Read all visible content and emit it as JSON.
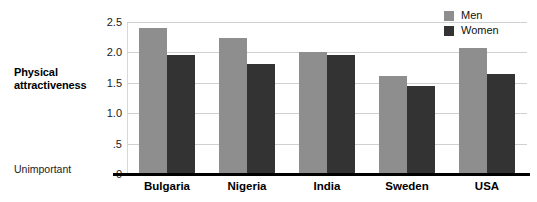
{
  "axis": {
    "y_title": "Physical attractiveness",
    "baseline_caption": "Unimportant",
    "y_ticks": [
      "2.5",
      "2.0",
      "1.5",
      "1.0",
      ".5",
      "0"
    ]
  },
  "legend": {
    "items": [
      {
        "label": "Men",
        "color": "#8e8e8e",
        "swatch": "legend-swatch-men"
      },
      {
        "label": "Women",
        "color": "#333333",
        "swatch": "legend-swatch-women"
      }
    ]
  },
  "chart_data": {
    "type": "bar",
    "title": "",
    "xlabel": "",
    "ylabel": "Physical attractiveness",
    "ylim": [
      0,
      2.5
    ],
    "yticks": [
      0,
      0.5,
      1.0,
      1.5,
      2.0,
      2.5
    ],
    "ytick_labels": [
      "0",
      ".5",
      "1.0",
      "1.5",
      "2.0",
      "2.5"
    ],
    "y_axis_low_annotation": "Unimportant",
    "grid": true,
    "legend_position": "top-right",
    "categories": [
      "Bulgaria",
      "Nigeria",
      "India",
      "Sweden",
      "USA"
    ],
    "series": [
      {
        "name": "Men",
        "color": "#8e8e8e",
        "values": [
          2.4,
          2.23,
          2.01,
          1.62,
          2.08
        ]
      },
      {
        "name": "Women",
        "color": "#333333",
        "values": [
          1.95,
          1.81,
          1.95,
          1.44,
          1.64
        ]
      }
    ]
  }
}
